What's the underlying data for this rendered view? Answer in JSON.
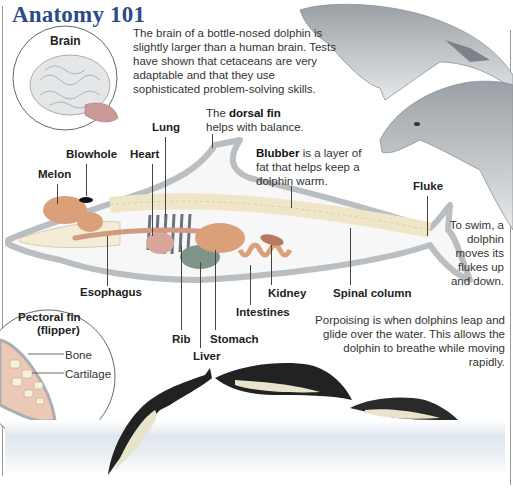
{
  "title": "Anatomy 101",
  "brain_inset": {
    "label": "Brain"
  },
  "brain_text": "The brain of a bottle-nosed dolphin is slightly larger than a human brain. Tests have shown that cetaceans are very adaptable and that they use sophisticated problem-solving skills.",
  "dorsal_fin_text": {
    "prefix": "The ",
    "bold": "dorsal fin",
    "suffix": "helps with balance."
  },
  "blubber_text": {
    "bold": "Blubber",
    "rest": " is a layer of fat that helps keep a dolphin warm."
  },
  "fluke_text": "To swim, a dolphin moves its flukes up and down.",
  "labels": {
    "lung": "Lung",
    "blowhole": "Blowhole",
    "heart": "Heart",
    "melon": "Melon",
    "fluke": "Fluke",
    "esophagus": "Esophagus",
    "kidney": "Kidney",
    "spinal_column": "Spinal column",
    "intestines": "Intestines",
    "rib": "Rib",
    "stomach": "Stomach",
    "liver": "Liver"
  },
  "pectoral_inset": {
    "title_line1": "Pectoral fin",
    "title_line2": "(flipper)",
    "bone": "Bone",
    "cartilage": "Cartilage"
  },
  "porpoising_text": "Porpoising is when dolphins leap and glide over the water. This allows the dolphin to breathe while moving rapidly.",
  "colors": {
    "title": "#2b4a8a",
    "body_outline": "#b9bec2",
    "organ": "#d9a07a",
    "liver": "#7f9488",
    "water": "#dde5ee"
  }
}
